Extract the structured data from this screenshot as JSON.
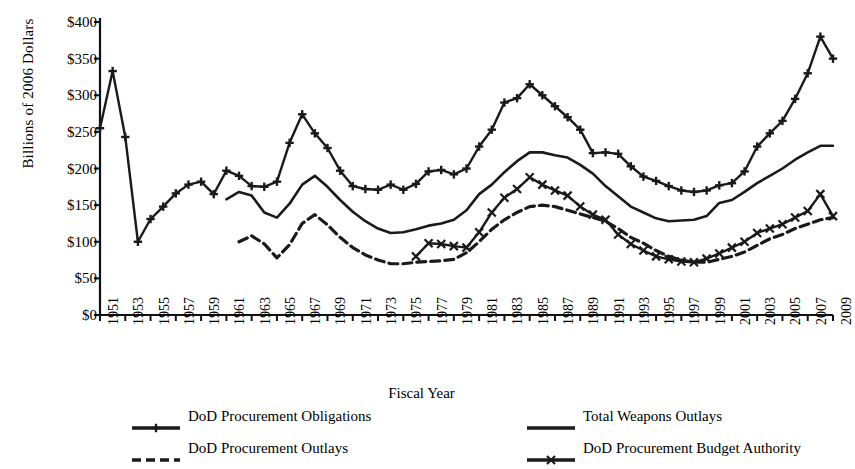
{
  "chart_data": {
    "type": "line",
    "title": "",
    "xlabel": "Fiscal Year",
    "ylabel": "Billions of 2006 Dollars",
    "ylim": [
      0,
      400
    ],
    "ytick_labels": [
      "$0",
      "$50",
      "$100",
      "$150",
      "$200",
      "$250",
      "$300",
      "$350",
      "$400"
    ],
    "ytick_values": [
      0,
      50,
      100,
      150,
      200,
      250,
      300,
      350,
      400
    ],
    "xlim": [
      1951,
      2009
    ],
    "xtick_labels": [
      "1951",
      "1953",
      "1955",
      "1957",
      "1959",
      "1961",
      "1963",
      "1965",
      "1967",
      "1969",
      "1971",
      "1973",
      "1975",
      "1977",
      "1979",
      "1981",
      "1983",
      "1985",
      "1987",
      "1989",
      "1991",
      "1993",
      "1995",
      "1997",
      "1999",
      "2001",
      "2003",
      "2005",
      "2007",
      "2009"
    ],
    "xtick_values": [
      1951,
      1953,
      1955,
      1957,
      1959,
      1961,
      1963,
      1965,
      1967,
      1969,
      1971,
      1973,
      1975,
      1977,
      1979,
      1981,
      1983,
      1985,
      1987,
      1989,
      1991,
      1993,
      1995,
      1997,
      1999,
      2001,
      2003,
      2005,
      2007,
      2009
    ],
    "grid": false,
    "legend_position": "bottom",
    "series": [
      {
        "name": "DoD Procurement Obligations",
        "marker": "plus",
        "dash": "solid",
        "color": "#1a1a1a",
        "x": [
          1951,
          1952,
          1953,
          1954,
          1955,
          1956,
          1957,
          1958,
          1959,
          1960,
          1961,
          1962,
          1963,
          1964,
          1965,
          1966,
          1967,
          1968,
          1969,
          1970,
          1971,
          1972,
          1973,
          1974,
          1975,
          1976,
          1977,
          1978,
          1979,
          1980,
          1981,
          1982,
          1983,
          1984,
          1985,
          1986,
          1987,
          1988,
          1989,
          1990,
          1991,
          1992,
          1993,
          1994,
          1995,
          1996,
          1997,
          1998,
          1999,
          2000,
          2001,
          2002,
          2003,
          2004,
          2005,
          2006,
          2007,
          2008,
          2009
        ],
        "y": [
          255,
          333,
          243,
          100,
          131,
          148,
          166,
          178,
          182,
          165,
          197,
          190,
          176,
          175,
          182,
          235,
          274,
          248,
          228,
          197,
          176,
          172,
          171,
          178,
          171,
          179,
          196,
          198,
          192,
          200,
          230,
          253,
          290,
          296,
          315,
          300,
          285,
          270,
          253,
          221,
          222,
          220,
          203,
          189,
          183,
          176,
          170,
          168,
          170,
          177,
          180,
          196,
          230,
          248,
          265,
          295,
          330,
          380,
          350
        ]
      },
      {
        "name": "Total Weapons Outlays",
        "marker": "none",
        "dash": "solid",
        "color": "#1a1a1a",
        "x": [
          1961,
          1962,
          1963,
          1964,
          1965,
          1966,
          1967,
          1968,
          1969,
          1970,
          1971,
          1972,
          1973,
          1974,
          1975,
          1976,
          1977,
          1978,
          1979,
          1980,
          1981,
          1982,
          1983,
          1984,
          1985,
          1986,
          1987,
          1988,
          1989,
          1990,
          1991,
          1992,
          1993,
          1994,
          1995,
          1996,
          1997,
          1998,
          1999,
          2000,
          2001,
          2002,
          2003,
          2004,
          2005,
          2006,
          2007,
          2008,
          2009
        ],
        "y": [
          158,
          168,
          163,
          140,
          133,
          152,
          178,
          190,
          175,
          157,
          141,
          128,
          118,
          112,
          113,
          117,
          122,
          125,
          130,
          143,
          165,
          178,
          195,
          210,
          222,
          222,
          218,
          215,
          205,
          193,
          176,
          162,
          148,
          140,
          132,
          128,
          129,
          130,
          135,
          153,
          157,
          168,
          180,
          190,
          200,
          212,
          222,
          231,
          231
        ]
      },
      {
        "name": "DoD Procurement Outlays",
        "marker": "none",
        "dash": "dashed",
        "color": "#1a1a1a",
        "x": [
          1962,
          1963,
          1964,
          1965,
          1966,
          1967,
          1968,
          1969,
          1970,
          1971,
          1972,
          1973,
          1974,
          1975,
          1976,
          1977,
          1978,
          1979,
          1980,
          1981,
          1982,
          1983,
          1984,
          1985,
          1986,
          1987,
          1988,
          1989,
          1990,
          1991,
          1992,
          1993,
          1994,
          1995,
          1996,
          1997,
          1998,
          1999,
          2000,
          2001,
          2002,
          2003,
          2004,
          2005,
          2006,
          2007,
          2008,
          2009
        ],
        "y": [
          100,
          108,
          97,
          78,
          96,
          125,
          137,
          123,
          106,
          92,
          82,
          75,
          70,
          70,
          72,
          73,
          74,
          76,
          85,
          100,
          117,
          130,
          140,
          148,
          150,
          148,
          143,
          138,
          133,
          128,
          118,
          106,
          98,
          88,
          80,
          75,
          72,
          72,
          76,
          80,
          86,
          95,
          104,
          110,
          118,
          124,
          130,
          133
        ]
      },
      {
        "name": "DoD Procurement Budget Authority",
        "marker": "cross",
        "dash": "solid",
        "color": "#1a1a1a",
        "x": [
          1976,
          1977,
          1978,
          1979,
          1980,
          1981,
          1982,
          1983,
          1984,
          1985,
          1986,
          1987,
          1988,
          1989,
          1990,
          1991,
          1992,
          1993,
          1994,
          1995,
          1996,
          1997,
          1998,
          1999,
          2000,
          2001,
          2002,
          2003,
          2004,
          2005,
          2006,
          2007,
          2008,
          2009
        ],
        "y": [
          80,
          98,
          97,
          94,
          92,
          113,
          140,
          160,
          172,
          188,
          178,
          170,
          163,
          148,
          137,
          130,
          110,
          97,
          88,
          80,
          76,
          73,
          72,
          77,
          84,
          92,
          100,
          112,
          118,
          124,
          133,
          142,
          165,
          135
        ]
      }
    ]
  },
  "legend": {
    "items": [
      {
        "label": "DoD Procurement Obligations",
        "icon": "line-plus-marker-icon"
      },
      {
        "label": "Total Weapons Outlays",
        "icon": "line-solid-icon"
      },
      {
        "label": "DoD Procurement Outlays",
        "icon": "line-dashed-icon"
      },
      {
        "label": "DoD Procurement Budget Authority",
        "icon": "line-cross-marker-icon"
      }
    ]
  }
}
